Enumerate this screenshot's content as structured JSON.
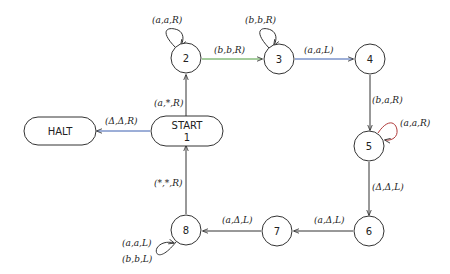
{
  "diagram": {
    "type": "turing-machine-state-diagram",
    "nodes": [
      {
        "id": "halt",
        "label": "HALT",
        "shape": "rounded-rect"
      },
      {
        "id": "start",
        "label": "START",
        "sublabel": "1",
        "shape": "rounded-rect"
      },
      {
        "id": "s2",
        "label": "2",
        "shape": "circle"
      },
      {
        "id": "s3",
        "label": "3",
        "shape": "circle"
      },
      {
        "id": "s4",
        "label": "4",
        "shape": "circle"
      },
      {
        "id": "s5",
        "label": "5",
        "shape": "circle"
      },
      {
        "id": "s6",
        "label": "6",
        "shape": "circle"
      },
      {
        "id": "s7",
        "label": "7",
        "shape": "circle"
      },
      {
        "id": "s8",
        "label": "8",
        "shape": "circle"
      }
    ],
    "edges": [
      {
        "from": "start",
        "to": "halt",
        "label": "(Δ,Δ,R)",
        "color": "#3a5fb0"
      },
      {
        "from": "start",
        "to": "s2",
        "label": "(a,*,R)",
        "color": "#333333"
      },
      {
        "from": "s2",
        "to": "s2",
        "label": "(a,a,R)",
        "color": "#333333"
      },
      {
        "from": "s2",
        "to": "s3",
        "label": "(b,b,R)",
        "color": "#4a9a3a"
      },
      {
        "from": "s3",
        "to": "s3",
        "label": "(b,b,R)",
        "color": "#333333"
      },
      {
        "from": "s3",
        "to": "s4",
        "label": "(a,a,L)",
        "color": "#3a5fb0"
      },
      {
        "from": "s4",
        "to": "s5",
        "label": "(b,a,R)",
        "color": "#333333"
      },
      {
        "from": "s5",
        "to": "s5",
        "label": "(a,a,R)",
        "color": "#b03a3a"
      },
      {
        "from": "s5",
        "to": "s6",
        "label": "(Δ,Δ,L)",
        "color": "#333333"
      },
      {
        "from": "s6",
        "to": "s7",
        "label": "(a,Δ,L)",
        "color": "#333333"
      },
      {
        "from": "s7",
        "to": "s8",
        "label": "(a,Δ,L)",
        "color": "#333333"
      },
      {
        "from": "s8",
        "to": "s8",
        "label": "(a,a,L)",
        "label2": "(b,b,L)",
        "color": "#333333"
      },
      {
        "from": "s8",
        "to": "start",
        "label": "(*,*,R)",
        "color": "#333333"
      }
    ]
  }
}
